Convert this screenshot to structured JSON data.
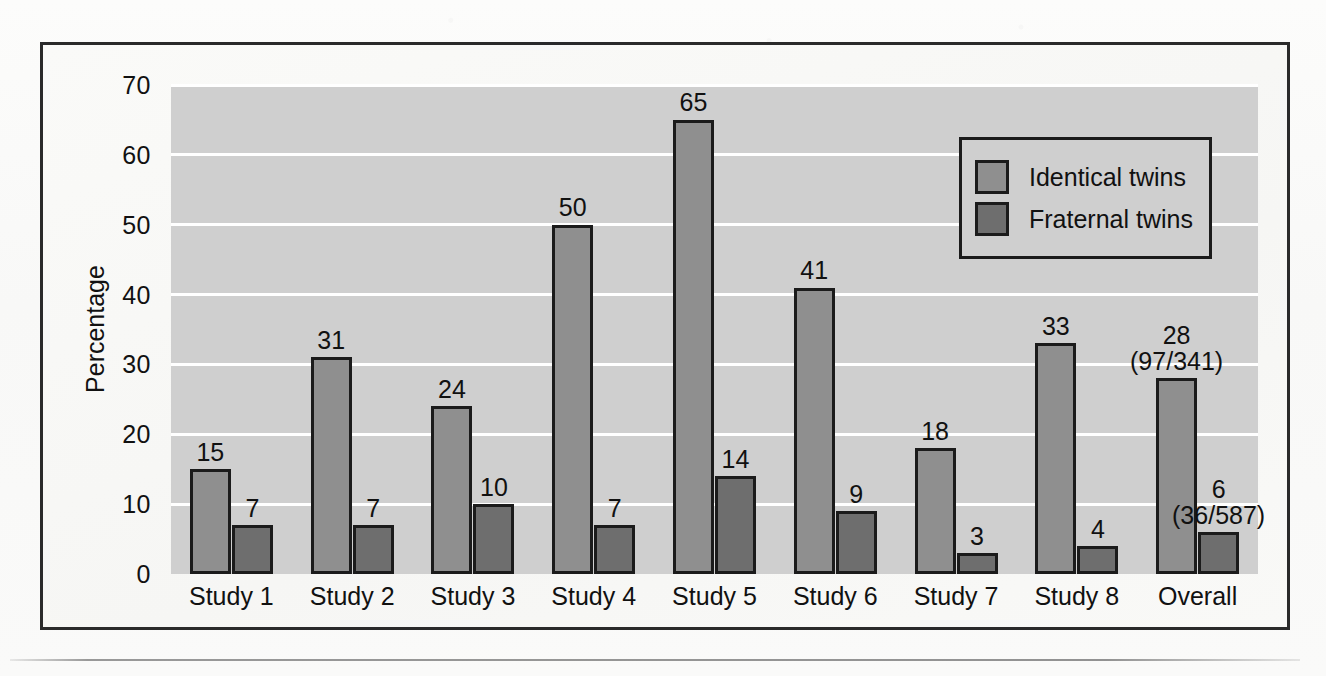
{
  "chart_data": {
    "type": "bar",
    "title": "",
    "subtitle": "",
    "xlabel": "",
    "ylabel": "Percentage",
    "ylim": [
      0,
      70
    ],
    "ytick_values": [
      0,
      10,
      20,
      30,
      40,
      50,
      60,
      70
    ],
    "ytick_labels": [
      "0",
      "10",
      "20",
      "30",
      "40",
      "50",
      "60",
      "70"
    ],
    "grid": "horizontal-only",
    "legend_position": "upper-right",
    "categories": [
      "Study 1",
      "Study 2",
      "Study 3",
      "Study 4",
      "Study 5",
      "Study 6",
      "Study 7",
      "Study 8",
      "Overall"
    ],
    "series": [
      {
        "name": "Identical twins",
        "color": "#8f8f8f",
        "values": [
          15,
          31,
          24,
          50,
          65,
          41,
          18,
          33,
          28
        ],
        "value_labels": [
          "15",
          "31",
          "24",
          "50",
          "65",
          "41",
          "18",
          "33",
          "28"
        ],
        "annotations": [
          "",
          "",
          "",
          "",
          "",
          "",
          "",
          "",
          "(97/341)"
        ]
      },
      {
        "name": "Fraternal twins",
        "color": "#6e6e6e",
        "values": [
          7,
          7,
          10,
          7,
          14,
          9,
          3,
          4,
          6
        ],
        "value_labels": [
          "7",
          "7",
          "10",
          "7",
          "14",
          "9",
          "3",
          "4",
          "6"
        ],
        "annotations": [
          "",
          "",
          "",
          "",
          "",
          "",
          "",
          "",
          "(36/587)"
        ]
      }
    ]
  },
  "legend": {
    "items": [
      {
        "label": "Identical twins",
        "swatch": "identical"
      },
      {
        "label": "Fraternal twins",
        "swatch": "fraternal"
      }
    ]
  },
  "colors": {
    "identical_twins": "#8f8f8f",
    "fraternal_twins": "#6e6e6e",
    "plot_background": "#cfcfcf",
    "gridline": "#ffffff",
    "bar_outline": "#1b1b1b",
    "frame": "#2a2a2a"
  }
}
